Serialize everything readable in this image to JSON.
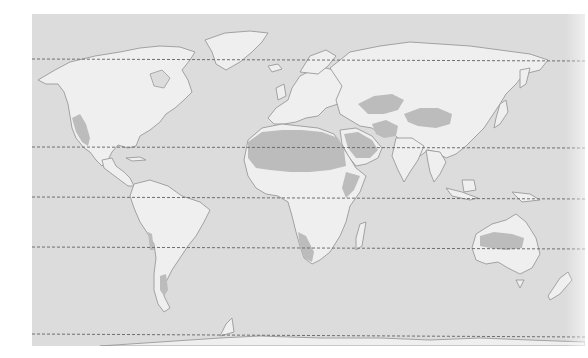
{
  "figure": {
    "type": "world-map",
    "theme": "desert-regions"
  },
  "colors": {
    "page_bg": "#ffffff",
    "ocean": "#dcdcdc",
    "land": "#efefef",
    "desert": "#bcbcbc",
    "coast": "#9a9a9a",
    "latline": "#6e6e6e"
  },
  "latitude_lines": [
    {
      "name": "arctic-circle",
      "y": 59
    },
    {
      "name": "tropic-of-cancer",
      "y": 147
    },
    {
      "name": "equator",
      "y": 197
    },
    {
      "name": "tropic-of-capricorn",
      "y": 247
    },
    {
      "name": "antarctic-circle",
      "y": 334
    }
  ],
  "regions": {
    "land": [
      "north-america",
      "greenland",
      "south-america",
      "europe",
      "africa",
      "asia",
      "arabia",
      "india",
      "southeast-asia",
      "japan",
      "madagascar",
      "australia",
      "new-zealand",
      "antarctica",
      "british-isles",
      "iceland",
      "new-guinea",
      "indonesia"
    ],
    "desert": [
      "north-american-desert",
      "sahara",
      "arabian-desert",
      "iranian-desert",
      "central-asian-desert",
      "gobi-taklamakan",
      "thar",
      "horn-of-africa",
      "kalahari-namib",
      "australian-desert",
      "patagonian-desert",
      "atacama"
    ]
  }
}
